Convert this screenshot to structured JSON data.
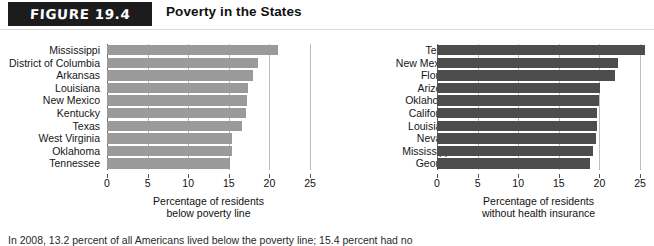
{
  "header": {
    "badge_label": "FIGURE 19.4",
    "title": "Poverty in the States"
  },
  "source_note": "In 2008, 13.2 percent of all Americans lived below the poverty line; 15.4 percent had no",
  "colors": {
    "badge_background": "#1c1c1c",
    "badge_text": "#ffffff",
    "poverty_bar": "#9a9a9a",
    "insurance_bar": "#4d4d4d",
    "gridline": "#bdbdbd",
    "axis": "#6a6a6a",
    "text": "#111111",
    "page_background": "#ffffff"
  },
  "chart_data": [
    {
      "id": "poverty",
      "type": "bar",
      "orientation": "horizontal",
      "title": "",
      "xlabel": "Percentage of residents below poverty line",
      "xlabel_line1": "Percentage of residents",
      "xlabel_line2": "below poverty line",
      "ylabel": "",
      "xlim": [
        0,
        25
      ],
      "ticks": [
        0,
        5,
        10,
        15,
        20,
        25
      ],
      "tick_labels": [
        "0",
        "5",
        "10",
        "15",
        "20",
        "25"
      ],
      "grid": true,
      "legend": "none",
      "bar_color": "#9a9a9a",
      "categories": [
        "Mississippi",
        "District of Columbia",
        "Arkansas",
        "Louisiana",
        "New Mexico",
        "Kentucky",
        "Texas",
        "West Virginia",
        "Oklahoma",
        "Tennessee"
      ],
      "values": [
        21.0,
        18.6,
        18.0,
        17.4,
        17.2,
        17.1,
        16.6,
        15.4,
        15.4,
        15.2
      ]
    },
    {
      "id": "insurance",
      "type": "bar",
      "orientation": "horizontal",
      "title": "",
      "xlabel": "Percentage of residents without health insurance",
      "xlabel_line1": "Percentage of residents",
      "xlabel_line2": "without health insurance",
      "ylabel": "",
      "xlim": [
        0,
        25
      ],
      "ticks": [
        0,
        5,
        10,
        15,
        20,
        25
      ],
      "tick_labels": [
        "0",
        "5",
        "10",
        "15",
        "20",
        "25"
      ],
      "grid": true,
      "legend": "none",
      "bar_color": "#4d4d4d",
      "categories": [
        "Texas",
        "New Mexico",
        "Florida",
        "Arizona",
        "Oklahoma",
        "California",
        "Louisiana",
        "Nevada",
        "Mississippi",
        "Georgia"
      ],
      "values": [
        25.6,
        22.3,
        21.9,
        20.1,
        19.9,
        19.7,
        19.7,
        19.6,
        19.2,
        18.8
      ]
    }
  ]
}
